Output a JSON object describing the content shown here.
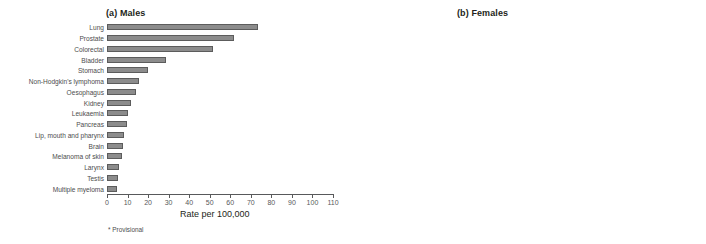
{
  "figure": {
    "footnote": "* Provisional"
  },
  "chart_data": [
    {
      "type": "bar",
      "orientation": "horizontal",
      "title": "(a) Males",
      "xlabel": "Rate per 100,000",
      "ylabel": "",
      "xlim": [
        0,
        110
      ],
      "xticks": [
        0,
        10,
        20,
        30,
        40,
        50,
        60,
        70,
        80,
        90,
        100,
        110
      ],
      "grid": false,
      "legend": "none",
      "bar_color": "#8c8c8c",
      "bar_edge_color": "#5c5c5c",
      "categories": [
        "Lung",
        "Prostate",
        "Colorectal",
        "Bladder",
        "Stomach",
        "Non-Hodgkin's lymphoma",
        "Oesophagus",
        "Kidney",
        "Leukaemia",
        "Pancreas",
        "Lip, mouth and pharynx",
        "Brain",
        "Melanoma of skin",
        "Larynx",
        "Testis",
        "Multiple myeloma"
      ],
      "values": [
        74,
        62,
        52,
        29,
        20,
        15.5,
        14,
        11.5,
        10.5,
        10,
        8.5,
        8,
        7.5,
        5.8,
        5.5,
        5
      ]
    },
    {
      "type": "bar",
      "orientation": "horizontal",
      "title": "(b) Females",
      "xlabel": "Rate per 100,000",
      "ylabel": "",
      "xlim": [
        0,
        110
      ],
      "xticks": [
        0,
        10,
        20,
        30,
        40,
        50,
        60,
        70,
        80,
        90,
        100,
        110
      ],
      "grid": false,
      "legend": "none",
      "bar_color": "#161616",
      "bar_edge_color": "#000000",
      "categories": [
        "Breast",
        "Colorectal",
        "Lung",
        "Ovary",
        "Uterus",
        "Non-Hodgkin's lymphoma",
        "Cervix",
        "Melanoma of skin",
        "Bladder",
        "Stomach",
        "Pancreas",
        "Oesophagus",
        "Leukaemia",
        "Kidney",
        "Brain",
        "Lip, mouth and pharynx",
        "Multiple myeloma"
      ],
      "values": [
        105,
        35,
        34.5,
        20,
        12.5,
        10,
        9.6,
        9.3,
        9,
        8,
        7.7,
        7.3,
        6.5,
        5.2,
        5,
        4,
        3.3
      ]
    }
  ]
}
